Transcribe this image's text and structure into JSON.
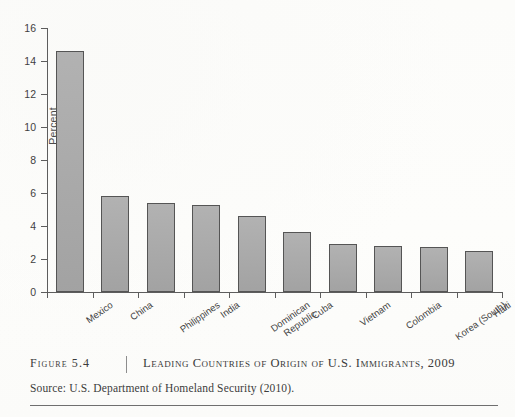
{
  "figure": {
    "number_label": "Figure 5.4",
    "title": "Leading Countries of Origin of U.S. Immigrants, 2009",
    "source": "Source: U.S. Department of Homeland Security (2010)."
  },
  "chart_data": {
    "type": "bar",
    "title": "",
    "xlabel": "",
    "ylabel": "Percent",
    "ylim": [
      0,
      16
    ],
    "yticks": [
      0,
      2,
      4,
      6,
      8,
      10,
      12,
      14,
      16
    ],
    "ytick_labels": [
      "0",
      "2",
      "4",
      "6",
      "8",
      "10",
      "12",
      "14",
      "16"
    ],
    "grid": false,
    "legend": false,
    "categories": [
      "Mexico",
      "China",
      "Philippines",
      "India",
      "Dominican\nRepublic",
      "Cuba",
      "Vietnam",
      "Colombia",
      "Korea (South)",
      "Haiti"
    ],
    "values": [
      14.6,
      5.8,
      5.4,
      5.3,
      4.6,
      3.65,
      2.9,
      2.8,
      2.7,
      2.5
    ],
    "bar_color": "#a9a9a9",
    "bar_edge_color": "#555555",
    "axis_color": "#5d5d5d"
  }
}
